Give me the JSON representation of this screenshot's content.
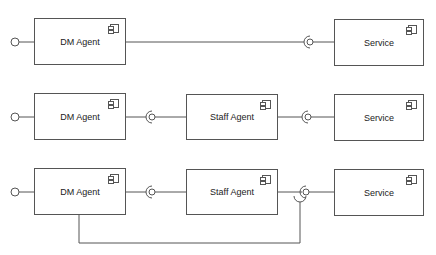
{
  "diagram": {
    "type": "uml-component",
    "rows": [
      {
        "components": [
          {
            "id": "dm1",
            "label": "DM Agent",
            "icon": "component-icon"
          },
          {
            "id": "svc1",
            "label": "Service",
            "icon": "component-icon"
          }
        ],
        "connections": [
          {
            "from": "dm1",
            "to": "svc1",
            "type": "assembly"
          }
        ]
      },
      {
        "components": [
          {
            "id": "dm2",
            "label": "DM Agent",
            "icon": "component-icon"
          },
          {
            "id": "staff2",
            "label": "Staff Agent",
            "icon": "component-icon"
          },
          {
            "id": "svc2",
            "label": "Service",
            "icon": "component-icon"
          }
        ],
        "connections": [
          {
            "from": "dm2",
            "to": "staff2",
            "type": "assembly"
          },
          {
            "from": "staff2",
            "to": "svc2",
            "type": "assembly"
          }
        ]
      },
      {
        "components": [
          {
            "id": "dm3",
            "label": "DM Agent",
            "icon": "component-icon"
          },
          {
            "id": "staff3",
            "label": "Staff Agent",
            "icon": "component-icon"
          },
          {
            "id": "svc3",
            "label": "Service",
            "icon": "component-icon"
          }
        ],
        "connections": [
          {
            "from": "dm3",
            "to": "staff3",
            "type": "assembly"
          },
          {
            "from": "staff3",
            "to": "svc3",
            "type": "assembly"
          },
          {
            "from": "dm3",
            "to": "svc3",
            "type": "assembly-routed-below"
          }
        ]
      }
    ],
    "colors": {
      "line": "#555555",
      "box_fill": "#ffffff",
      "text": "#222222"
    }
  }
}
